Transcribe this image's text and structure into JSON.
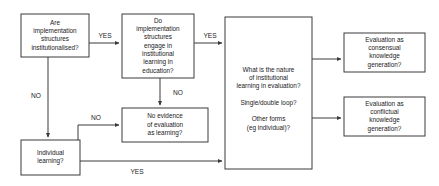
{
  "diagram": {
    "type": "flowchart",
    "background_color": "#ffffff",
    "line_color": "#3a3a3a",
    "text_color": "#1a1a1a",
    "nodes": [
      {
        "id": "institutionalised",
        "lines": [
          "Are",
          "implementation",
          "structures",
          "institutionalised?"
        ],
        "x": 21,
        "y": 14,
        "w": 68,
        "h": 43
      },
      {
        "id": "engage",
        "lines": [
          "Do",
          "implementation",
          "structures",
          "engage in",
          "institutional",
          "learning in",
          "education?"
        ],
        "x": 122,
        "y": 14,
        "w": 72,
        "h": 64
      },
      {
        "id": "no-evidence",
        "lines": [
          "No evidence",
          "of evaluation",
          "as learning?"
        ],
        "x": 122,
        "y": 108,
        "w": 86,
        "h": 34
      },
      {
        "id": "individual-learning",
        "lines": [
          "Individual",
          "learning?"
        ],
        "x": 21,
        "y": 140,
        "w": 59,
        "h": 35
      },
      {
        "id": "nature-of-learning",
        "lines": [
          "What is the nature",
          "of institutional",
          "learning in evaluation?",
          "",
          "Single/double loop?",
          "",
          "Other forms",
          "(eg individual)?"
        ],
        "x": 225,
        "y": 17,
        "w": 87,
        "h": 152
      },
      {
        "id": "consensual",
        "lines": [
          "Evaluation as",
          "consensual",
          "knowledge",
          "generation?"
        ],
        "x": 344,
        "y": 33,
        "w": 81,
        "h": 39
      },
      {
        "id": "conflictual",
        "lines": [
          "Evaluation as",
          "conflictual",
          "knowledge",
          "generation?"
        ],
        "x": 344,
        "y": 97,
        "w": 81,
        "h": 39
      }
    ],
    "edges": [
      {
        "id": "institutionalised-yes",
        "label": "YES",
        "label_x": 105,
        "label_y": 36,
        "from": "institutionalised",
        "to": "engage",
        "path": "M 89 43 L 119 43"
      },
      {
        "id": "engage-yes",
        "label": "YES",
        "label_x": 210,
        "label_y": 36,
        "from": "engage",
        "to": "nature-of-learning",
        "path": "M 194 43 L 222 43"
      },
      {
        "id": "engage-no",
        "label": "NO",
        "label_x": 178,
        "label_y": 93,
        "from": "engage",
        "to": "no-evidence",
        "path": "M 160 78 L 160 105"
      },
      {
        "id": "institutionalised-no",
        "label": "NO",
        "label_x": 36,
        "label_y": 96,
        "from": "institutionalised",
        "to": "individual-learning",
        "path": "M 48 57 L 48 137"
      },
      {
        "id": "individual-no",
        "label": "NO",
        "label_x": 96,
        "label_y": 118,
        "from": "individual-learning",
        "to": "no-evidence",
        "path": "M 78 140 L 78 125 L 119 125"
      },
      {
        "id": "individual-yes",
        "label": "YES",
        "label_x": 137,
        "label_y": 172,
        "from": "individual-learning",
        "to": "nature-of-learning",
        "path": "M 80 161 L 222 161"
      },
      {
        "id": "nature-consensual",
        "label": "",
        "label_x": 0,
        "label_y": 0,
        "from": "nature-of-learning",
        "to": "consensual",
        "path": "M 312 59 L 341 59"
      },
      {
        "id": "nature-conflictual",
        "label": "",
        "label_x": 0,
        "label_y": 0,
        "from": "nature-of-learning",
        "to": "conflictual",
        "path": "M 312 118 L 341 118"
      }
    ]
  }
}
